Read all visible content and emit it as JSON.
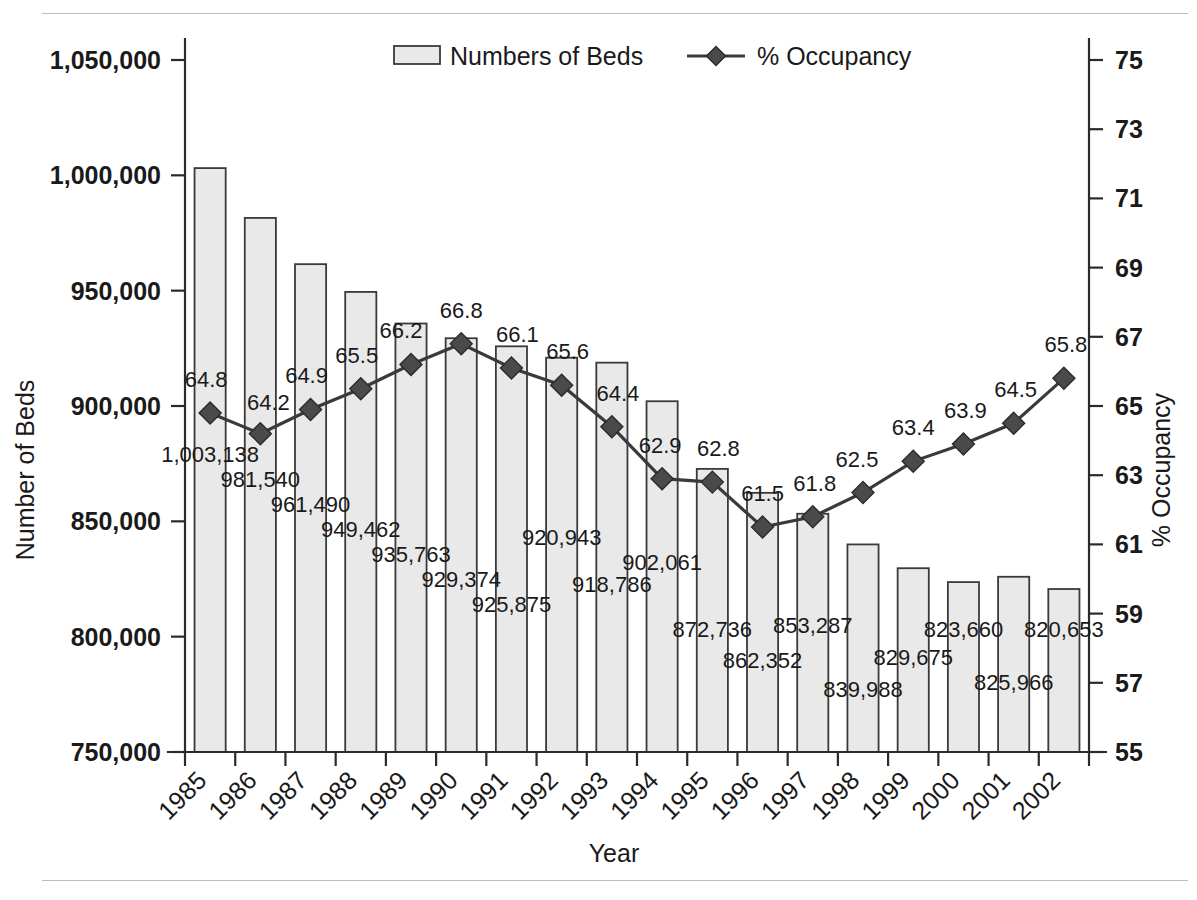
{
  "chart_data": {
    "type": "bar",
    "title": "",
    "xlabel": "Year",
    "ylabel": "Number of Beds",
    "y2label": "% Occupancy",
    "grid": false,
    "legend_position": "top-center",
    "categories": [
      "1985",
      "1986",
      "1987",
      "1988",
      "1989",
      "1990",
      "1991",
      "1992",
      "1993",
      "1994",
      "1995",
      "1996",
      "1997",
      "1998",
      "1999",
      "2000",
      "2001",
      "2002"
    ],
    "ylim": [
      750000,
      1050000
    ],
    "ytick_labels": [
      "1,050,000",
      "1,000,000",
      "950,000",
      "900,000",
      "850,000",
      "800,000",
      "750,000"
    ],
    "yticks": [
      1050000,
      1000000,
      950000,
      900000,
      850000,
      800000,
      750000
    ],
    "y2lim": [
      55,
      75
    ],
    "y2tick_labels": [
      "75",
      "73",
      "71",
      "69",
      "67",
      "65",
      "63",
      "61",
      "59",
      "57",
      "55"
    ],
    "y2ticks": [
      75,
      73,
      71,
      69,
      67,
      65,
      63,
      61,
      59,
      57,
      55
    ],
    "series": [
      {
        "name": "Numbers of Beds",
        "type": "bar",
        "axis": "left",
        "values": [
          1003138,
          981540,
          961490,
          949462,
          935763,
          929374,
          925875,
          920943,
          918786,
          902061,
          872736,
          862352,
          853287,
          839988,
          829675,
          823660,
          825966,
          820653
        ],
        "value_labels": [
          "1,003,138",
          "981,540",
          "961,490",
          "949,462",
          "935,763",
          "929,374",
          "925,875",
          "920,943",
          "918,786",
          "902,061",
          "872,736",
          "862,352",
          "853,287",
          "839,988",
          "829,675",
          "823,660",
          "825,966",
          "820,653"
        ]
      },
      {
        "name": "% Occupancy",
        "type": "line",
        "axis": "right",
        "values": [
          64.8,
          64.2,
          64.9,
          65.5,
          66.2,
          66.8,
          66.1,
          65.6,
          64.4,
          62.9,
          62.8,
          61.5,
          61.8,
          62.5,
          63.4,
          63.9,
          64.5,
          65.8
        ],
        "value_labels": [
          "64.8",
          "64.2",
          "64.9",
          "65.5",
          "66.2",
          "66.8",
          "66.1",
          "65.6",
          "64.4",
          "62.9",
          "62.8",
          "61.5",
          "61.8",
          "62.5",
          "63.4",
          "63.9",
          "64.5",
          "65.8"
        ]
      }
    ]
  },
  "legend": {
    "items": [
      {
        "label": "Numbers of Beds",
        "marker": "rect-swatch-icon",
        "color": "#e9e9e9"
      },
      {
        "label": "% Occupancy",
        "marker": "diamond-marker-icon",
        "color": "#4a4a4a"
      }
    ]
  },
  "axes": {
    "left_title": "Number of Beds",
    "right_title": "% Occupancy",
    "bottom_title": "Year"
  },
  "colors": {
    "bar_fill": "#e9e9e9",
    "bar_stroke": "#3a3a3a",
    "line_stroke": "#3a3a3a",
    "marker_fill": "#4a4a4a",
    "text": "#1a1a1a",
    "rule": "#b9bcc0"
  }
}
